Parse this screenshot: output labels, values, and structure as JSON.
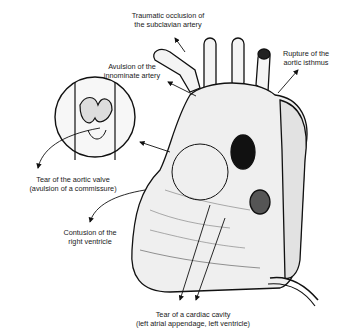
{
  "figure": {
    "labels": {
      "subclavian": [
        "Traumatic occlusion of",
        "the subclavian artery"
      ],
      "innominate": [
        "Avulsion of the",
        "innominate artery"
      ],
      "isthmus": [
        "Rupture of the",
        "aortic isthmus"
      ],
      "aortic_valve": [
        "Tear of the aortic valve",
        "(avulsion of a commissure)"
      ],
      "right_ventricle": [
        "Contusion of the",
        "right ventricle"
      ],
      "cardiac_cavity": [
        "Tear of a cardiac cavity",
        "(left atrial appendage, left ventricle)"
      ]
    }
  }
}
